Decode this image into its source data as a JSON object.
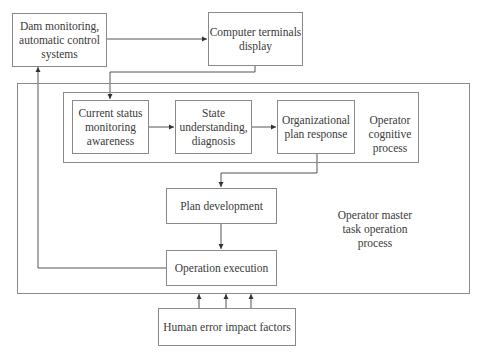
{
  "diagram": {
    "nodes": {
      "dam": {
        "label": "Dam monitoring,\nautomatic control\nsystems"
      },
      "terminals": {
        "label": "Computer terminals\ndisplay"
      },
      "current_status": {
        "label": "Current status\nmonitoring\nawareness"
      },
      "state_understanding": {
        "label": "State\nunderstanding,\ndiagnosis"
      },
      "org_plan": {
        "label": "Organizational\nplan response"
      },
      "plan_dev": {
        "label": "Plan development"
      },
      "op_exec": {
        "label": "Operation execution"
      },
      "human_error": {
        "label": "Human error impact factors"
      }
    },
    "groups": {
      "cognitive": {
        "label": "Operator\ncognitive process"
      },
      "master": {
        "label": "Operator master\ntask operation\nprocess"
      }
    },
    "edges": [
      {
        "from": "dam",
        "to": "terminals"
      },
      {
        "from": "terminals",
        "to": "current_status"
      },
      {
        "from": "current_status",
        "to": "state_understanding"
      },
      {
        "from": "state_understanding",
        "to": "org_plan"
      },
      {
        "from": "org_plan",
        "to": "plan_dev"
      },
      {
        "from": "plan_dev",
        "to": "op_exec"
      },
      {
        "from": "op_exec",
        "to": "dam"
      },
      {
        "from": "human_error",
        "to": "master"
      },
      {
        "from": "human_error",
        "to": "master"
      },
      {
        "from": "human_error",
        "to": "master"
      }
    ],
    "colors": {
      "line": "#555555",
      "border": "#8a8a8a",
      "text": "#3a3a3a"
    }
  }
}
